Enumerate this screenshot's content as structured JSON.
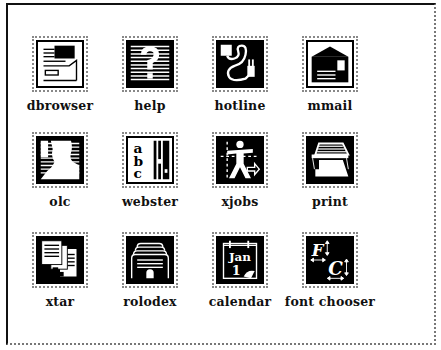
{
  "launcher": {
    "items": [
      {
        "label": "dbrowser",
        "icon": "file-cabinet-icon"
      },
      {
        "label": "help",
        "icon": "question-mark-icon"
      },
      {
        "label": "hotline",
        "icon": "phone-cord-plug-icon"
      },
      {
        "label": "mmail",
        "icon": "mailbox-envelope-icon"
      },
      {
        "label": "olc",
        "icon": "person-silhouette-icon"
      },
      {
        "label": "webster",
        "icon": "dictionary-abc-icon"
      },
      {
        "label": "xjobs",
        "icon": "worker-figure-icon"
      },
      {
        "label": "print",
        "icon": "printer-icon"
      },
      {
        "label": "xtar",
        "icon": "document-stack-icon"
      },
      {
        "label": "rolodex",
        "icon": "card-file-icon"
      },
      {
        "label": "calendar",
        "icon": "calendar-jan-1-icon"
      },
      {
        "label": "font chooser",
        "icon": "font-fc-icon"
      }
    ]
  },
  "calendar_icon": {
    "month": "Jan",
    "day": "1"
  },
  "font_icon": {
    "letter1": "F",
    "letter2": "C"
  },
  "webster_icon": {
    "a": "a",
    "b": "b",
    "c": "c"
  },
  "colors": {
    "icon_bg": "#000000",
    "frame_shadow": "#777777"
  }
}
